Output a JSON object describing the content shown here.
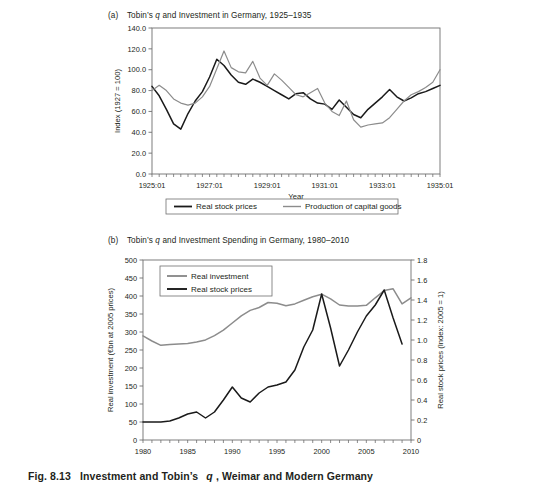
{
  "figure": {
    "caption_prefix": "Fig. 8.13",
    "caption_main": "Investment and Tobin’s",
    "caption_italic": "q",
    "caption_suffix": ", Weimar and Modern Germany"
  },
  "panel_a": {
    "label": "(a)",
    "title_pre": "Tobin’s",
    "title_italic": "q",
    "title_post": "and Investment in Germany, 1925–1935"
  },
  "panel_b": {
    "label": "(b)",
    "title_pre": "Tobin’s",
    "title_italic": "q",
    "title_post": "and Investment Spending in Germany, 1980–2010"
  },
  "colors": {
    "dark_line": "#1a1a1a",
    "gray_line": "#8c8c8c",
    "axis": "#6f6f6f",
    "text": "#231f20",
    "background": "#ffffff"
  },
  "chart_data": [
    {
      "type": "line",
      "title": "(a) Tobin's q and Investment in Germany, 1925-1935",
      "xlabel": "Year",
      "ylabel": "Index (1927 = 100)",
      "ylim": [
        0,
        140
      ],
      "yticks": [
        "0.0",
        "20.0",
        "40.0",
        "60.0",
        "80.0",
        "100.0",
        "120.0",
        "140.0"
      ],
      "ytick_values": [
        0,
        20,
        40,
        60,
        80,
        100,
        120,
        140
      ],
      "xlim": [
        1925.0,
        1935.0
      ],
      "xticks": [
        "1925:01",
        "1927:01",
        "1929:01",
        "1931:01",
        "1933:01",
        "1935:01"
      ],
      "xtick_values": [
        1925,
        1927,
        1929,
        1931,
        1933,
        1935
      ],
      "minor_xtick_step": 0.25,
      "grid": false,
      "legend_position": "below",
      "series": [
        {
          "name": "Real stock prices",
          "color": "#1a1a1a",
          "x": [
            1925.0,
            1925.25,
            1925.5,
            1925.75,
            1926.0,
            1926.25,
            1926.5,
            1926.75,
            1927.0,
            1927.25,
            1927.5,
            1927.75,
            1928.0,
            1928.25,
            1928.5,
            1928.75,
            1929.0,
            1929.25,
            1929.5,
            1929.75,
            1930.0,
            1930.25,
            1930.5,
            1930.75,
            1931.0,
            1931.25,
            1931.5,
            1931.75,
            1932.0,
            1932.25,
            1932.5,
            1932.75,
            1933.0,
            1933.25,
            1933.5,
            1933.75,
            1934.0,
            1934.25,
            1934.5,
            1934.75,
            1935.0
          ],
          "y": [
            84,
            75,
            62,
            48,
            43,
            58,
            70,
            79,
            93,
            110,
            104,
            95,
            88,
            86,
            91,
            88,
            84,
            80,
            76,
            72,
            77,
            78,
            72,
            68,
            67,
            62,
            71,
            64,
            57,
            54,
            62,
            68,
            74,
            81,
            74,
            70,
            73,
            77,
            79,
            82,
            85
          ]
        },
        {
          "name": "Production of capital goods",
          "color": "#8c8c8c",
          "x": [
            1925.0,
            1925.25,
            1925.5,
            1925.75,
            1926.0,
            1926.25,
            1926.5,
            1926.75,
            1927.0,
            1927.25,
            1927.5,
            1927.75,
            1928.0,
            1928.25,
            1928.5,
            1928.75,
            1929.0,
            1929.25,
            1929.5,
            1929.75,
            1930.0,
            1930.25,
            1930.5,
            1930.75,
            1931.0,
            1931.25,
            1931.5,
            1931.75,
            1932.0,
            1932.25,
            1932.5,
            1932.75,
            1933.0,
            1933.25,
            1933.5,
            1933.75,
            1934.0,
            1934.25,
            1934.5,
            1934.75,
            1935.0
          ],
          "y": [
            80,
            85,
            80,
            72,
            68,
            66,
            68,
            74,
            84,
            101,
            118,
            102,
            98,
            97,
            108,
            92,
            85,
            96,
            90,
            83,
            76,
            74,
            78,
            82,
            68,
            60,
            56,
            70,
            52,
            45,
            47,
            48,
            49,
            54,
            62,
            70,
            76,
            79,
            83,
            88,
            100
          ]
        }
      ]
    },
    {
      "type": "line",
      "title": "(b) Tobin's q and Investment Spending in Germany, 1980-2010",
      "xlabel": "",
      "ylabel_left": "Real investment (€bn at 2005 prices)",
      "ylabel_right": "Real stock prices (Index: 2005 = 1)",
      "ylim_left": [
        0,
        500
      ],
      "yticks_left": [
        "0",
        "50",
        "100",
        "150",
        "200",
        "250",
        "300",
        "350",
        "400",
        "450",
        "500"
      ],
      "ytick_values_left": [
        0,
        50,
        100,
        150,
        200,
        250,
        300,
        350,
        400,
        450,
        500
      ],
      "ylim_right": [
        0,
        1.8
      ],
      "yticks_right": [
        "0",
        "0.2",
        "0.4",
        "0.6",
        "0.8",
        "1.0",
        "1.2",
        "1.4",
        "1.6",
        "1.8"
      ],
      "ytick_values_right": [
        0,
        0.2,
        0.4,
        0.6,
        0.8,
        1.0,
        1.2,
        1.4,
        1.6,
        1.8
      ],
      "xlim": [
        1980,
        2010
      ],
      "xticks": [
        "1980",
        "1985",
        "1990",
        "1995",
        "2000",
        "2005",
        "2010"
      ],
      "xtick_values": [
        1980,
        1985,
        1990,
        1995,
        2000,
        2005,
        2010
      ],
      "minor_xtick_step": 1,
      "grid": false,
      "legend_position": "top-left",
      "series": [
        {
          "name": "Real investment",
          "color": "#8c8c8c",
          "axis": "left",
          "x": [
            1980,
            1981,
            1982,
            1983,
            1984,
            1985,
            1986,
            1987,
            1988,
            1989,
            1990,
            1991,
            1992,
            1993,
            1994,
            1995,
            1996,
            1997,
            1998,
            1999,
            2000,
            2001,
            2002,
            2003,
            2004,
            2005,
            2006,
            2007,
            2008,
            2009,
            2010
          ],
          "y": [
            289,
            275,
            263,
            265,
            267,
            268,
            272,
            278,
            290,
            305,
            325,
            345,
            360,
            368,
            382,
            380,
            373,
            378,
            388,
            398,
            405,
            392,
            375,
            372,
            372,
            374,
            395,
            415,
            420,
            378,
            395
          ]
        },
        {
          "name": "Real stock prices",
          "color": "#1a1a1a",
          "axis": "right",
          "x": [
            1980,
            1981,
            1982,
            1983,
            1984,
            1985,
            1986,
            1987,
            1988,
            1989,
            1990,
            1991,
            1992,
            1993,
            1994,
            1995,
            1996,
            1997,
            1998,
            1999,
            2000,
            2001,
            2002,
            2003,
            2004,
            2005,
            2006,
            2007,
            2008,
            2009
          ],
          "y": [
            0.18,
            0.18,
            0.18,
            0.19,
            0.22,
            0.26,
            0.28,
            0.22,
            0.28,
            0.4,
            0.53,
            0.42,
            0.38,
            0.47,
            0.53,
            0.55,
            0.58,
            0.7,
            0.93,
            1.1,
            1.46,
            1.12,
            0.74,
            0.9,
            1.08,
            1.24,
            1.35,
            1.5,
            1.22,
            0.96
          ]
        }
      ]
    }
  ]
}
